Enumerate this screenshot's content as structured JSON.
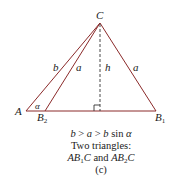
{
  "figure": {
    "vertices": {
      "apex": "C",
      "left": "A",
      "inner_base": "B",
      "inner_base_sub": "2",
      "outer_base": "B",
      "outer_base_sub": "1"
    },
    "side_labels": {
      "left_side": "b",
      "inner_side": "a",
      "altitude": "h",
      "right_side": "a"
    },
    "angle_label": "α",
    "colors": {
      "triangle_stroke": "#8b2a2a",
      "altitude_stroke": "#333333",
      "text": "#1a1a1a"
    }
  },
  "caption": {
    "condition": {
      "b1": "b",
      "gt1": " > ",
      "a": "a",
      "gt2": " > ",
      "b2": "b",
      "sin": " sin ",
      "alpha": "α"
    },
    "line2": "Two triangles:",
    "line3": {
      "t1_a": "AB",
      "t1_sub": "1",
      "t1_c": "C",
      "and": " and ",
      "t2_a": "AB",
      "t2_sub": "2",
      "t2_c": "C"
    },
    "line4": "(c)"
  }
}
